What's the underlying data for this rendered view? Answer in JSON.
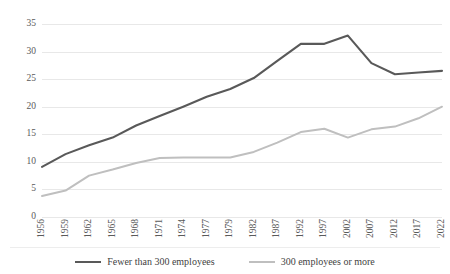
{
  "chart_data": {
    "type": "line",
    "title": "",
    "xlabel": "",
    "ylabel": "",
    "ylim": [
      0,
      35
    ],
    "grid": true,
    "legend_position": "bottom",
    "categories": [
      "1956",
      "1959",
      "1962",
      "1965",
      "1968",
      "1971",
      "1974",
      "1977",
      "1979",
      "1982",
      "1987",
      "1992",
      "1997",
      "2002",
      "2007",
      "2012",
      "2017",
      "2022"
    ],
    "yticks": [
      "0",
      "5",
      "10",
      "15",
      "20",
      "25",
      "30",
      "35"
    ],
    "series": [
      {
        "name": "Fewer than 300 employees",
        "color": "#595959",
        "values": [
          9.1,
          11.4,
          13.0,
          14.4,
          16.6,
          18.3,
          20.0,
          21.8,
          23.2,
          25.2,
          28.3,
          31.4,
          31.4,
          32.9,
          27.9,
          25.9,
          26.2,
          26.5
        ]
      },
      {
        "name": "300 employees or more",
        "color": "#bfbfbf",
        "values": [
          3.8,
          4.8,
          7.5,
          8.6,
          9.8,
          10.7,
          10.8,
          10.8,
          10.8,
          11.8,
          13.5,
          15.4,
          16.0,
          14.4,
          15.9,
          16.4,
          17.9,
          20.0
        ]
      }
    ]
  },
  "legend": {
    "items": [
      {
        "label": "Fewer than 300 employees",
        "color": "#595959"
      },
      {
        "label": "300 employees or more",
        "color": "#bfbfbf"
      }
    ]
  }
}
